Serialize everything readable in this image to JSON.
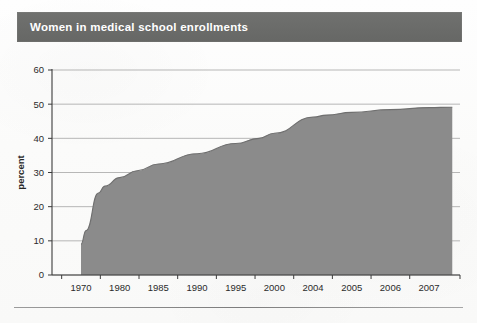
{
  "title": {
    "text": "Women in medical school enrollments",
    "bar_color": "#6b6c6a",
    "text_color": "#ffffff"
  },
  "chart_data": {
    "type": "area",
    "title": "Women in medical school enrollments",
    "xlabel": "",
    "ylabel": "percent",
    "categories": [
      "1970",
      "1980",
      "1985",
      "1990",
      "1995",
      "2000",
      "2004",
      "2005",
      "2006",
      "2007"
    ],
    "values": [
      13,
      26,
      31,
      35,
      39,
      43,
      47,
      48,
      48.5,
      49
    ],
    "series": [
      {
        "name": "percent",
        "values": [
          13,
          26,
          31,
          35,
          39,
          43,
          47,
          48,
          48.5,
          49
        ]
      }
    ],
    "curve_points": [
      {
        "x": 0.0,
        "y": 9
      },
      {
        "x": 0.13,
        "y": 13
      },
      {
        "x": 0.45,
        "y": 24
      },
      {
        "x": 0.62,
        "y": 26
      },
      {
        "x": 1.0,
        "y": 28.5
      },
      {
        "x": 1.45,
        "y": 30.5
      },
      {
        "x": 2.0,
        "y": 32.5
      },
      {
        "x": 3.0,
        "y": 35.5
      },
      {
        "x": 4.0,
        "y": 38.5
      },
      {
        "x": 4.6,
        "y": 40
      },
      {
        "x": 5.0,
        "y": 41.5
      },
      {
        "x": 6.0,
        "y": 46.2
      },
      {
        "x": 6.35,
        "y": 46.8
      },
      {
        "x": 7.0,
        "y": 47.6
      },
      {
        "x": 8.0,
        "y": 48.4
      },
      {
        "x": 9.0,
        "y": 49
      },
      {
        "x": 9.6,
        "y": 49.1
      }
    ],
    "ylim": [
      0,
      60
    ],
    "ytick_step": 10,
    "yticks": [
      "0",
      "10",
      "20",
      "30",
      "40",
      "50",
      "60"
    ],
    "grid": true,
    "grid_axis": "y",
    "legend": "none",
    "fill_color": "#8b8b8b",
    "axis_color": "#3b3b3b",
    "grid_color": "#9a9a9a"
  }
}
